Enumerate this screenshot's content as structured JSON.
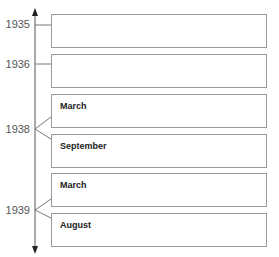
{
  "timeline": {
    "years": [
      {
        "label": "1935"
      },
      {
        "label": "1936"
      },
      {
        "label": "1938"
      },
      {
        "label": "1939"
      }
    ],
    "entries": [
      {
        "year": "1935",
        "label": ""
      },
      {
        "year": "1936",
        "label": ""
      },
      {
        "year": "1938",
        "label": "March"
      },
      {
        "year": "1938",
        "label": "September"
      },
      {
        "year": "1939",
        "label": "March"
      },
      {
        "year": "1939",
        "label": "August"
      }
    ]
  }
}
